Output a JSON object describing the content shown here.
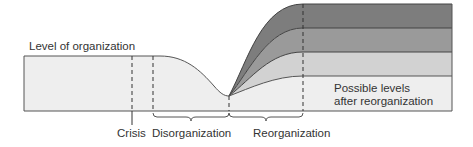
{
  "diagram": {
    "y_label": "Level of organization",
    "annotation": {
      "line1": "Possible levels",
      "line2": "after reorganization"
    },
    "phases": [
      {
        "label": "Crisis"
      },
      {
        "label": "Disorganization"
      },
      {
        "label": "Reorganization"
      }
    ],
    "levels": [
      {
        "name": "level-highest",
        "color": "#7d7d7d"
      },
      {
        "name": "level-high",
        "color": "#9a9a9a"
      },
      {
        "name": "level-medium",
        "color": "#d2d2d2"
      },
      {
        "name": "level-low",
        "color": "#eeeeee"
      }
    ],
    "colors": {
      "baseline_fill": "#eeeeee",
      "outline": "#555555"
    }
  }
}
